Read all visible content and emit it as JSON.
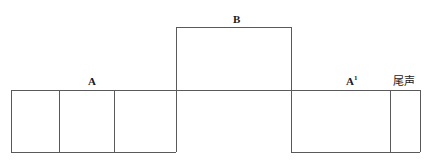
{
  "diagram": {
    "type": "musical-form-structure",
    "canvas": {
      "width": 432,
      "height": 163,
      "background": "#ffffff"
    },
    "line_color": "#5a5a5a",
    "baseline_y": 90,
    "sections": [
      {
        "id": "section-a",
        "label": "A",
        "label_x": 88,
        "label_y": 76,
        "level": "low",
        "x_start": 11,
        "x_end": 176,
        "y_top": 90,
        "y_bottom": 152,
        "cells": 3,
        "dividers": [
          59,
          114
        ]
      },
      {
        "id": "section-b",
        "label": "B",
        "label_x": 233,
        "label_y": 14,
        "level": "high",
        "x_start": 176,
        "x_end": 291,
        "y_top": 27,
        "y_bottom": 152,
        "cells": 1,
        "dividers": []
      },
      {
        "id": "section-a1",
        "label": "A",
        "label_superscript": "1",
        "label_x": 346,
        "label_y": 76,
        "level": "low",
        "x_start": 291,
        "x_end": 390,
        "y_top": 90,
        "y_bottom": 152,
        "cells": 1,
        "dividers": []
      },
      {
        "id": "section-coda",
        "label": "尾声",
        "label_x": 395,
        "label_y": 76,
        "level": "low",
        "x_start": 390,
        "x_end": 420,
        "y_top": 90,
        "y_bottom": 152,
        "cells": 1,
        "dividers": []
      }
    ]
  }
}
